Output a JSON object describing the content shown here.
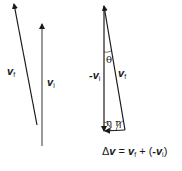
{
  "diagram": {
    "vectors_left": {
      "vf": {
        "symbol": "v",
        "subscript": "f"
      },
      "vi": {
        "symbol": "v",
        "subscript": "i"
      }
    },
    "triangle": {
      "neg_vi": {
        "prefix": "-",
        "symbol": "v",
        "subscript": "i"
      },
      "vf": {
        "symbol": "v",
        "subscript": "f"
      },
      "angle_top": "θ",
      "angles_bottom": "η η",
      "equation": {
        "delta": "Δ",
        "lhs": "v",
        "equals": " = ",
        "t1": "v",
        "t1_sub": "f",
        "plus": " + (",
        "t2_prefix": "-",
        "t2": "v",
        "t2_sub": "i",
        "close": ")"
      }
    },
    "colors": {
      "stroke": "#1a1a1a",
      "left_vi_stroke": "#555555"
    }
  }
}
